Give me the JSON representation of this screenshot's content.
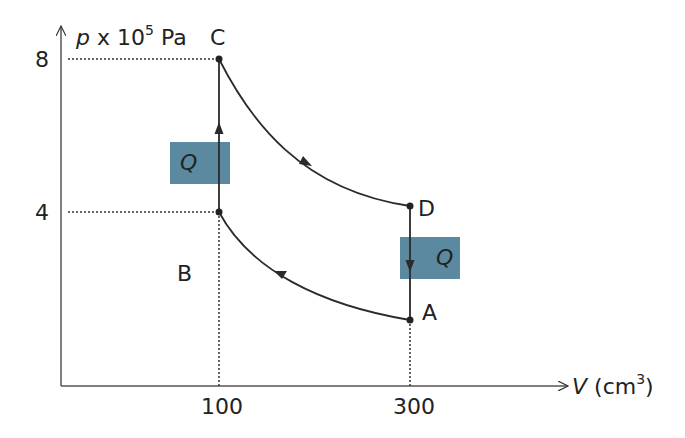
{
  "diagram": {
    "type": "pV thermodynamic cycle",
    "axes": {
      "y_label_var": "p",
      "y_label_rest": " x 10",
      "y_label_exp": "5",
      "y_label_unit": " Pa",
      "x_label_var": "V",
      "x_label_unit_open": " (cm",
      "x_label_exp": "3",
      "x_label_unit_close": ")",
      "y_ticks": [
        "8",
        "4"
      ],
      "x_ticks": [
        "100",
        "300"
      ]
    },
    "points": {
      "A": {
        "label": "A",
        "V": 300,
        "p": 1.4
      },
      "B": {
        "label": "B",
        "V": 100,
        "p": 4
      },
      "C": {
        "label": "C",
        "V": 100,
        "p": 8
      },
      "D": {
        "label": "D",
        "V": 300,
        "p": 4.2
      }
    },
    "processes": [
      {
        "from": "B",
        "to": "C",
        "kind": "isochoric",
        "heat": "Q in"
      },
      {
        "from": "C",
        "to": "D",
        "kind": "adiabatic expansion"
      },
      {
        "from": "D",
        "to": "A",
        "kind": "isochoric",
        "heat": "Q out"
      },
      {
        "from": "A",
        "to": "B",
        "kind": "adiabatic compression"
      }
    ],
    "heat_labels": {
      "left": "Q",
      "right": "Q"
    },
    "colors": {
      "heat_box": "#5b8aa0",
      "line": "#2a2a2a"
    }
  }
}
